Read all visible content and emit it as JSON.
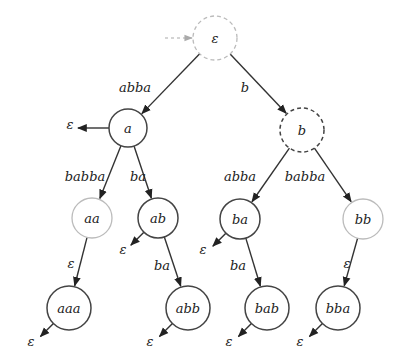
{
  "diagram": {
    "type": "prefix-tree-automaton",
    "initial_arrow": {
      "to": "eps"
    },
    "nodes": [
      {
        "id": "eps",
        "label": "ε",
        "x": 215,
        "y": 38,
        "r": 22,
        "style": "dashed-light"
      },
      {
        "id": "a",
        "label": "a",
        "x": 128,
        "y": 128,
        "r": 19,
        "style": "solid"
      },
      {
        "id": "b",
        "label": "b",
        "x": 302,
        "y": 130,
        "r": 22,
        "style": "dashed"
      },
      {
        "id": "aa",
        "label": "aa",
        "x": 92,
        "y": 218,
        "r": 20,
        "style": "light"
      },
      {
        "id": "ab",
        "label": "ab",
        "x": 158,
        "y": 218,
        "r": 20,
        "style": "solid"
      },
      {
        "id": "ba",
        "label": "ba",
        "x": 240,
        "y": 219,
        "r": 20,
        "style": "solid"
      },
      {
        "id": "bb",
        "label": "bb",
        "x": 363,
        "y": 219,
        "r": 20,
        "style": "light"
      },
      {
        "id": "aaa",
        "label": "aaa",
        "x": 69,
        "y": 308,
        "r": 22,
        "style": "solid"
      },
      {
        "id": "abb",
        "label": "abb",
        "x": 188,
        "y": 308,
        "r": 22,
        "style": "solid"
      },
      {
        "id": "bab",
        "label": "bab",
        "x": 267,
        "y": 308,
        "r": 22,
        "style": "solid"
      },
      {
        "id": "bba",
        "label": "bba",
        "x": 338,
        "y": 308,
        "r": 22,
        "style": "solid"
      }
    ],
    "edges": [
      {
        "from": "eps",
        "to": "a",
        "label": "abba",
        "lx": 135,
        "ly": 92
      },
      {
        "from": "eps",
        "to": "b",
        "label": "b",
        "lx": 245,
        "ly": 92
      },
      {
        "from": "a",
        "to": "aa",
        "label": "babba",
        "lx": 85,
        "ly": 181
      },
      {
        "from": "a",
        "to": "ab",
        "label": "ba",
        "lx": 138,
        "ly": 181
      },
      {
        "from": "b",
        "to": "ba",
        "label": "abba",
        "lx": 240,
        "ly": 181
      },
      {
        "from": "b",
        "to": "bb",
        "label": "babba",
        "lx": 305,
        "ly": 181
      },
      {
        "from": "aa",
        "to": "aaa",
        "label": "ε",
        "lx": 71,
        "ly": 268
      },
      {
        "from": "ab",
        "to": "abb",
        "label": "ba",
        "lx": 162,
        "ly": 270
      },
      {
        "from": "ba",
        "to": "bab",
        "label": "ba",
        "lx": 238,
        "ly": 270
      },
      {
        "from": "bb",
        "to": "bba",
        "label": "ε",
        "lx": 347,
        "ly": 268
      }
    ],
    "outputs": [
      {
        "from": "a",
        "label": "ε",
        "lx": 70,
        "ly": 129
      },
      {
        "from": "ab",
        "label": "ε",
        "lx": 123,
        "ly": 254
      },
      {
        "from": "ba",
        "label": "ε",
        "lx": 203,
        "ly": 254
      },
      {
        "from": "aaa",
        "label": "ε",
        "lx": 31,
        "ly": 346
      },
      {
        "from": "abb",
        "label": "ε",
        "lx": 150,
        "ly": 346
      },
      {
        "from": "bab",
        "label": "ε",
        "lx": 229,
        "ly": 346
      },
      {
        "from": "bba",
        "label": "ε",
        "lx": 300,
        "ly": 346
      }
    ]
  }
}
